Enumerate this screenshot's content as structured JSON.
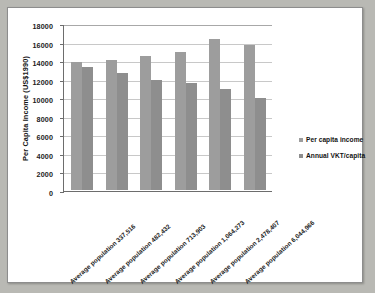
{
  "chart_data": {
    "type": "bar",
    "title": "",
    "xlabel": "",
    "ylabel": "Per Capita Income (US$1990)",
    "ylim": [
      0,
      18000
    ],
    "ytick_step": 2000,
    "yticks": [
      18000,
      16000,
      14000,
      12000,
      10000,
      8000,
      6000,
      4000,
      2000,
      0
    ],
    "ytick_labels": [
      "18000",
      "16000",
      "14000",
      "12000",
      "10000",
      "8000",
      "6000",
      "4000",
      "2000",
      "0"
    ],
    "grid": true,
    "legend_position": "right",
    "categories": [
      "Average population 337,516",
      "Average population 482,432",
      "Average population 713,903",
      "Average population 1,064,273",
      "Average population 2,478,407",
      "Average population 6,044,966"
    ],
    "series": [
      {
        "name": "Per capita income",
        "color": "#9d9d9d",
        "values": [
          13800,
          14000,
          14400,
          14900,
          16300,
          15600
        ]
      },
      {
        "name": "Annual VKT/capita",
        "color": "#8e8e8e",
        "values": [
          13250,
          12650,
          11850,
          11500,
          10900,
          9950
        ]
      }
    ]
  },
  "legend": {
    "items": [
      {
        "label": "Per capita income"
      },
      {
        "label": "Annual VKT/capita"
      }
    ]
  }
}
